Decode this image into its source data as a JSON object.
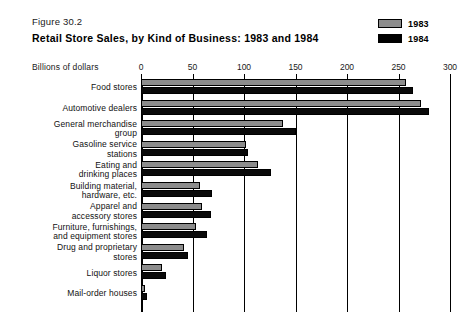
{
  "figure": {
    "number": "Figure 30.2",
    "title": "Retail Store Sales, by Kind of Business: 1983 and 1984"
  },
  "legend": {
    "position": "top-right",
    "entries": [
      {
        "label": "1983",
        "color": "#8c8c8c"
      },
      {
        "label": "1984",
        "color": "#000000"
      }
    ]
  },
  "axis": {
    "unit_label": "Billions of dollars",
    "ticks": [
      "0",
      "50",
      "100",
      "150",
      "200",
      "250",
      "300"
    ]
  },
  "chart_data": {
    "type": "bar",
    "orientation": "horizontal",
    "title": "Retail Store Sales, by Kind of Business: 1983 and 1984",
    "subtitle": "Figure 30.2",
    "xlabel": "Billions of dollars",
    "ylabel": "",
    "xlim": [
      0,
      300
    ],
    "xticks": [
      0,
      50,
      100,
      150,
      200,
      250,
      300
    ],
    "grid": true,
    "legend_position": "top-right",
    "categories": [
      "Food stores",
      "Automotive dealers",
      "General merchandise group",
      "Gasoline service stations",
      "Eating and drinking places",
      "Building material, hardware, etc.",
      "Apparel and accessory stores",
      "Furniture, furnishings, and equipment stores",
      "Drug and proprietary stores",
      "Liquor stores",
      "Mail-order houses"
    ],
    "category_lines": [
      [
        "Food stores"
      ],
      [
        "Automotive dealers"
      ],
      [
        "General merchandise",
        "group"
      ],
      [
        "Gasoline service",
        "stations"
      ],
      [
        "Eating and",
        "drinking places"
      ],
      [
        "Building material,",
        "hardware, etc."
      ],
      [
        "Apparel and",
        "accessory stores"
      ],
      [
        "Furniture, furnishings,",
        "and equipment stores"
      ],
      [
        "Drug and proprietary",
        "stores"
      ],
      [
        "Liquor stores"
      ],
      [
        "Mail-order houses"
      ]
    ],
    "series": [
      {
        "name": "1983",
        "color": "#8c8c8c",
        "values": [
          257,
          272,
          138,
          102,
          114,
          57,
          59,
          53,
          42,
          20,
          4
        ]
      },
      {
        "name": "1984",
        "color": "#000000",
        "values": [
          264,
          280,
          150,
          104,
          126,
          69,
          68,
          64,
          46,
          24,
          6
        ]
      }
    ]
  }
}
